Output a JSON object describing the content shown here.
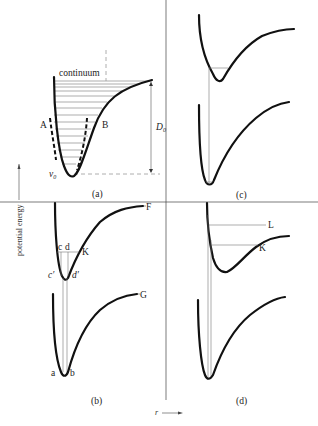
{
  "axes": {
    "y_label": "potential energy",
    "x_label": "r"
  },
  "panels": [
    {
      "id": "a",
      "caption": "(a)",
      "labels": {
        "continuum": "continuum",
        "A": "A",
        "B": "B",
        "D0": "D",
        "D0_sub": "0",
        "v0": "v",
        "v0_sub": "0"
      }
    },
    {
      "id": "b",
      "caption": "(b)",
      "labels": {
        "F": "F",
        "G": "G",
        "K": "K",
        "c": "c",
        "d": "d",
        "c_prime": "c′",
        "d_prime": "d′",
        "a": "a",
        "b": "b"
      }
    },
    {
      "id": "c",
      "caption": "(c)",
      "labels": {}
    },
    {
      "id": "d",
      "caption": "(d)",
      "labels": {
        "L": "L",
        "K": "K"
      }
    }
  ]
}
